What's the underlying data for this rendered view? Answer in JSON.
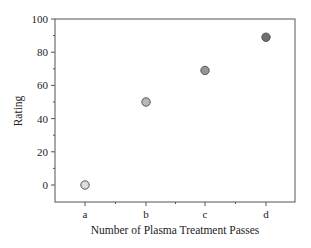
{
  "chart_data": {
    "type": "scatter",
    "title": "",
    "xlabel": "Number of Plasma Treatment Passes",
    "ylabel": "Rating",
    "categories": [
      "a",
      "b",
      "c",
      "d"
    ],
    "values": [
      0,
      50,
      69,
      89
    ],
    "point_colors": [
      "#dcdcdc",
      "#b8b8b8",
      "#959595",
      "#6e6e6e"
    ],
    "ylim": [
      -12,
      100
    ],
    "yticks": [
      0,
      20,
      40,
      60,
      80,
      100
    ],
    "grid": false,
    "legend": null
  }
}
